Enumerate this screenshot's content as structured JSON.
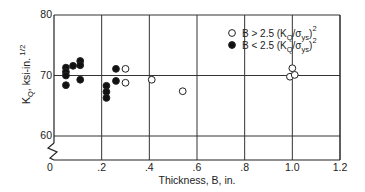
{
  "chart_data": {
    "type": "scatter",
    "title": "",
    "xlabel": "Thickness, B, in.",
    "ylabel": "K_Q, ksi-in. 1/2",
    "ylabel_parts": {
      "main": "K",
      "sub": "Q",
      "rest": ", ksi-in.",
      "sup": "1/2"
    },
    "xlim": [
      0,
      1.2
    ],
    "ylim": [
      60,
      80
    ],
    "y_axis_break": true,
    "grid": true,
    "x_ticks": [
      0,
      0.2,
      0.4,
      0.6,
      0.8,
      1.0,
      1.2
    ],
    "x_tick_labels": [
      "0",
      ".2",
      ".4",
      ".6",
      ".8",
      "1.0",
      "1.2"
    ],
    "y_ticks": [
      60,
      70,
      80
    ],
    "y_tick_labels": [
      "60",
      "70",
      "80"
    ],
    "legend_position": "upper right",
    "series": [
      {
        "name": "B > 2.5 (KQ/σys)^2",
        "marker": "open-circle",
        "legend_label": {
          "pre": "B > 2.5 (K",
          "sub1": "Q",
          "mid": "/σ",
          "sub2": "ys",
          "post": ")",
          "sup": "2"
        },
        "points": [
          [
            0.3,
            71.1
          ],
          [
            0.3,
            68.8
          ],
          [
            0.41,
            69.3
          ],
          [
            0.54,
            67.4
          ],
          [
            1.0,
            71.2
          ],
          [
            0.99,
            69.8
          ],
          [
            1.01,
            70.1
          ]
        ]
      },
      {
        "name": "B < 2.5 (KQ/σys)^2",
        "marker": "filled-circle",
        "legend_label": {
          "pre": "B < 2.5 (K",
          "sub1": "Q",
          "mid": "/σ",
          "sub2": "ys",
          "post": ")",
          "sup": "2"
        },
        "points": [
          [
            0.05,
            71.3
          ],
          [
            0.05,
            70.6
          ],
          [
            0.05,
            70.0
          ],
          [
            0.05,
            68.4
          ],
          [
            0.08,
            71.6
          ],
          [
            0.11,
            72.4
          ],
          [
            0.11,
            71.7
          ],
          [
            0.11,
            69.3
          ],
          [
            0.22,
            68.3
          ],
          [
            0.22,
            67.3
          ],
          [
            0.22,
            66.3
          ],
          [
            0.26,
            71.1
          ],
          [
            0.26,
            69.1
          ]
        ]
      }
    ]
  }
}
